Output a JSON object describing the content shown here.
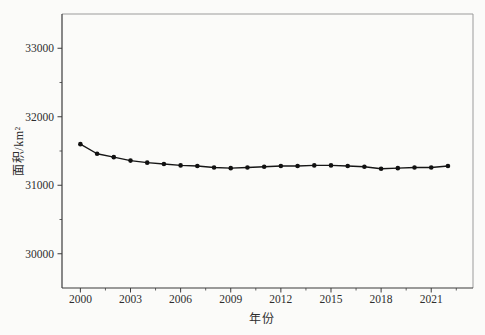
{
  "figure": {
    "background": "#fbfbf9",
    "axis_color": "#3b3b3b",
    "frame_light_color": "#9b9b9b",
    "text_color": "#2e2e2e",
    "tick_font_size": 11.5
  },
  "chart_data": {
    "type": "line",
    "title": "",
    "xlabel": "年份",
    "ylabel": "面积/km²",
    "x": [
      2000,
      2001,
      2002,
      2003,
      2004,
      2005,
      2006,
      2007,
      2008,
      2009,
      2010,
      2011,
      2012,
      2013,
      2014,
      2015,
      2016,
      2017,
      2018,
      2019,
      2020,
      2021,
      2022
    ],
    "values": [
      31600,
      31460,
      31410,
      31360,
      31330,
      31310,
      31290,
      31280,
      31260,
      31250,
      31260,
      31270,
      31280,
      31280,
      31290,
      31290,
      31280,
      31270,
      31240,
      31250,
      31260,
      31260,
      31280
    ],
    "series_name": "面积",
    "xlim": [
      1998.9,
      2023.5
    ],
    "ylim": [
      29500,
      33500
    ],
    "x_major_ticks": [
      2000,
      2003,
      2006,
      2009,
      2012,
      2015,
      2018,
      2021
    ],
    "x_minor_ticks": [
      2001.5,
      2004.5,
      2007.5,
      2010.5,
      2013.5,
      2016.5,
      2019.5,
      2022.5
    ],
    "y_major_ticks": [
      30000,
      31000,
      32000,
      33000
    ],
    "y_minor_ticks": [
      30500,
      31500,
      32500
    ],
    "grid": false,
    "legend_position": "none",
    "line_color": "#161616",
    "marker": "filled-circle",
    "marker_color": "#111111",
    "line_width": 1.4,
    "marker_radius": 2.3
  }
}
